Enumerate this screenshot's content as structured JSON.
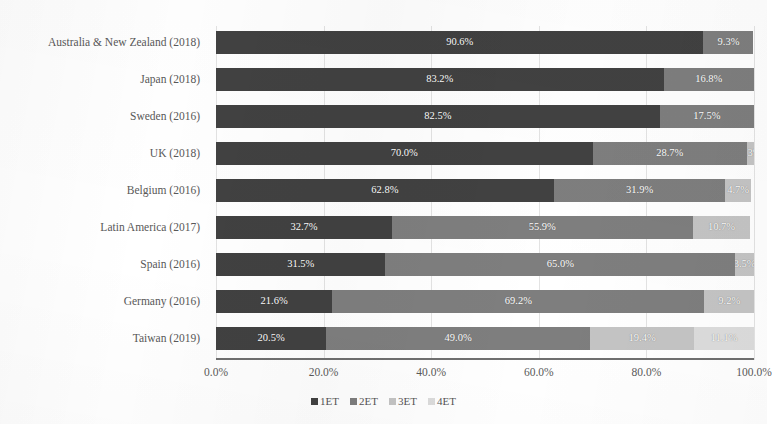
{
  "chart_data": {
    "type": "bar",
    "orientation": "horizontal",
    "stacked": true,
    "stack_mode": "percent",
    "title": "",
    "xlabel": "",
    "ylabel": "",
    "xlim": [
      0,
      100
    ],
    "grid": true,
    "grid_axis": "x",
    "legend_position": "bottom",
    "xticks": [
      "0.0%",
      "20.0%",
      "40.0%",
      "60.0%",
      "80.0%",
      "100.0%"
    ],
    "xtick_values": [
      0,
      20,
      40,
      60,
      80,
      100
    ],
    "categories": [
      "Australia & New Zealand (2018)",
      "Japan (2018)",
      "Sweden (2016)",
      "UK (2018)",
      "Belgium (2016)",
      "Latin America (2017)",
      "Spain (2016)",
      "Germany (2016)",
      "Taiwan (2019)"
    ],
    "series": [
      {
        "name": "1ET",
        "color": "#414141",
        "values": [
          90.6,
          83.2,
          82.5,
          70.0,
          62.8,
          32.7,
          31.5,
          21.6,
          20.5
        ],
        "labels": [
          "90.6%",
          "83.2%",
          "82.5%",
          "70.0%",
          "62.8%",
          "32.7%",
          "31.5%",
          "21.6%",
          "20.5%"
        ]
      },
      {
        "name": "2ET",
        "color": "#7e7e7e",
        "values": [
          9.3,
          16.8,
          17.5,
          28.7,
          31.9,
          55.9,
          65.0,
          69.2,
          49.0
        ],
        "labels": [
          "9.3%",
          "16.8%",
          "17.5%",
          "28.7%",
          "31.9%",
          "55.9%",
          "65.0%",
          "69.2%",
          "49.0%"
        ]
      },
      {
        "name": "3ET",
        "color": "#c4c4c4",
        "values": [
          0,
          0,
          0,
          1.3,
          4.7,
          10.7,
          3.5,
          9.2,
          19.4
        ],
        "labels": [
          "",
          "",
          "",
          "1.3%",
          "4.7%",
          "10.7%",
          "3.5%",
          "9.2%",
          "19.4%"
        ]
      },
      {
        "name": "4ET",
        "color": "#dcdcdc",
        "values": [
          0,
          0,
          0,
          0,
          0,
          0,
          0,
          0,
          11.1
        ],
        "labels": [
          "",
          "",
          "",
          "",
          "",
          "",
          "",
          "",
          "11.1%"
        ]
      }
    ]
  },
  "legend": {
    "items": [
      {
        "label": "1ET",
        "color": "#414141"
      },
      {
        "label": "2ET",
        "color": "#7e7e7e"
      },
      {
        "label": "3ET",
        "color": "#c4c4c4"
      },
      {
        "label": "4ET",
        "color": "#dcdcdc"
      }
    ]
  }
}
